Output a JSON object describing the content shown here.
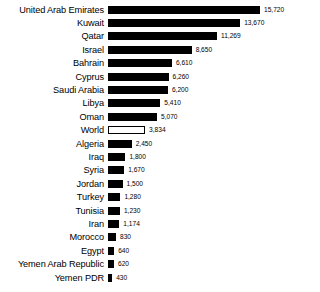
{
  "chart_data": {
    "type": "bar",
    "orientation": "horizontal",
    "title": "",
    "subtitle": "",
    "xlabel": "",
    "ylabel": "",
    "grid": false,
    "legend": "none",
    "axis_visible": false,
    "xlim": [
      0,
      15720
    ],
    "categories": [
      "United Arab Emirates",
      "Kuwait",
      "Qatar",
      "Israel",
      "Bahrain",
      "Cyprus",
      "Saudi Arabia",
      "Libya",
      "Oman",
      "World",
      "Algeria",
      "Iraq",
      "Syria",
      "Jordan",
      "Turkey",
      "Tunisia",
      "Iran",
      "Morocco",
      "Egypt",
      "Yemen Arab Republic",
      "Yemen PDR"
    ],
    "values": [
      15720,
      13670,
      11269,
      8650,
      6610,
      6260,
      6200,
      5410,
      5070,
      3834,
      2450,
      1800,
      1670,
      1500,
      1280,
      1230,
      1174,
      830,
      640,
      620,
      430
    ],
    "value_labels": [
      "15,720",
      "13,670",
      "11,269",
      "8,650",
      "6,610",
      "6,260",
      "6,200",
      "5,410",
      "5,070",
      "3,834",
      "2,450",
      "1,800",
      "1,670",
      "1,500",
      "1,280",
      "1,230",
      "1,174",
      "830",
      "640",
      "620",
      "430"
    ],
    "highlighted_category": "World",
    "bar_fill_color": "#000000",
    "bar_highlight_fill_color": "#ffffff",
    "bar_highlight_border_color": "#000000",
    "background_color": "#ffffff"
  }
}
